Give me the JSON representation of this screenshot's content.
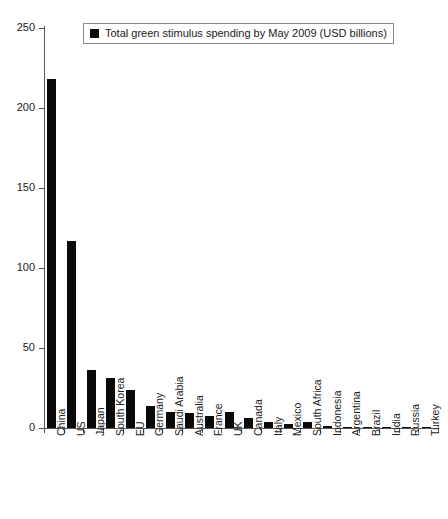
{
  "chart_data": {
    "type": "bar",
    "title": "",
    "subtitle": "",
    "xlabel": "",
    "ylabel": "",
    "ylim": [
      0,
      250
    ],
    "yticks": [
      0,
      50,
      100,
      150,
      200,
      250
    ],
    "grid": false,
    "legend_position": "top-center",
    "series_color": "#0a0a0a",
    "legend": [
      "Total green stimulus spending by May 2009 (USD billions)"
    ],
    "categories": [
      "China",
      "US",
      "Japan",
      "South Korea",
      "EU",
      "Germany",
      "Saudi Arabia",
      "Australia",
      "France",
      "UK",
      "Canada",
      "Italy",
      "Mexico",
      "South Africa",
      "Indonesia",
      "Argentina",
      "Brazil",
      "India",
      "Russia",
      "Turkey"
    ],
    "values": [
      218,
      117,
      36,
      31,
      24,
      13.5,
      10,
      9.5,
      7.5,
      10,
      6.5,
      4,
      2.5,
      3.5,
      1,
      0.8,
      0.6,
      0.5,
      0.3,
      0.2
    ],
    "series": [
      {
        "name": "Total green stimulus spending by May 2009 (USD billions)",
        "values": [
          218,
          117,
          36,
          31,
          24,
          13.5,
          10,
          9.5,
          7.5,
          10,
          6.5,
          4,
          2.5,
          3.5,
          1,
          0.8,
          0.6,
          0.5,
          0.3,
          0.2
        ]
      }
    ]
  },
  "legend": {
    "label": "Total green stimulus spending by May 2009 (USD billions)",
    "swatch_color": "#0a0a0a"
  },
  "axes": {
    "y_tick_labels": [
      "250",
      "200",
      "150",
      "100",
      "50",
      "0"
    ],
    "y_max": 250,
    "y_min": 0
  }
}
